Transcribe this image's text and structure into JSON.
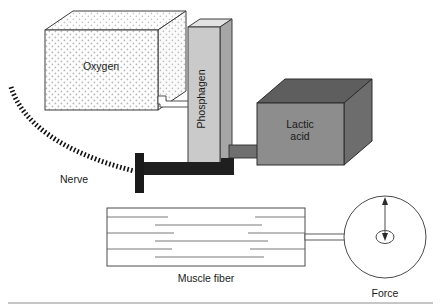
{
  "figure": {
    "background_color": "#ffffff",
    "width": 441,
    "height": 308
  },
  "labels": {
    "oxygen": "Oxygen",
    "phosphagen": "Phosphagen",
    "lactic_acid_line1": "Lactic",
    "lactic_acid_line2": "acid",
    "nerve": "Nerve",
    "muscle_fiber": "Muscle fiber",
    "force": "Force"
  },
  "components": {
    "oxygen_box": {
      "name": "Oxygen",
      "fill": "#fdfdfd",
      "stroke": "#3a3a3a",
      "pattern": "stippled-dots",
      "pattern_color": "#b9b9b9",
      "shape": "3d-box"
    },
    "phosphagen_column": {
      "name": "Phosphagen",
      "fill": "#c9c9c9",
      "top_fill": "#e0e0e0",
      "side_fill": "#a8a8a8",
      "stroke": "#3a3a3a",
      "shape": "3d-column",
      "text_orientation": "vertical-bottom-to-top"
    },
    "lactic_acid_box": {
      "name": "Lactic acid",
      "fill": "#8c8c8c",
      "top_fill": "#5f5f5f",
      "side_fill": "#6e6e6e",
      "stroke": "#2f2f2f",
      "shape": "3d-box"
    },
    "nerve": {
      "name": "Nerve",
      "style": "dashed-curve",
      "color": "#111111"
    },
    "tendon_bar": {
      "name": "tendon bar",
      "color": "#1a1a1a"
    },
    "muscle_fiber": {
      "name": "Muscle fiber",
      "fill": "#ffffff",
      "stroke": "#4a4a4a",
      "internal_line_count": 7
    },
    "force_gauge": {
      "name": "Force",
      "fill": "#ffffff",
      "stroke": "#4a4a4a",
      "indicator": "double-headed-vertical-arrow",
      "hub": "small-ellipse"
    },
    "oxygen_to_phosphagen_tube": {
      "name": "oxygen supply tube",
      "fill": "#ffffff",
      "stroke": "#3a3a3a"
    },
    "phosphagen_to_lactic_tube": {
      "name": "lactic acid tube",
      "fill": "#6e6e6e",
      "stroke": "#2f2f2f"
    },
    "muscle_to_force_rod": {
      "name": "force transmission rod",
      "fill": "#ffffff",
      "stroke": "#4a4a4a"
    },
    "baseline_rule": {
      "name": "bottom divider rule",
      "color": "#8a8a8a"
    }
  }
}
